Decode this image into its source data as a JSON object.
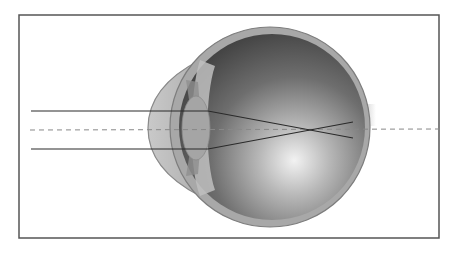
{
  "diagram": {
    "rays": [
      {
        "name": "upper-ray",
        "entry_side": "above-axis"
      },
      {
        "name": "lower-ray",
        "entry_side": "below-axis"
      }
    ],
    "focal_point_relative_to_retina": "in-front",
    "optical_axis_style": "dashed",
    "colors": {
      "frame": "#555555",
      "ray": "#2a2a2a",
      "axis": "#888888",
      "sclera": "#9a9a9a",
      "interior_dark": "#4a4a4a",
      "interior_light": "#e8e8e8",
      "cornea": "#bdbdbd",
      "lens": "#a9a9a9"
    }
  }
}
